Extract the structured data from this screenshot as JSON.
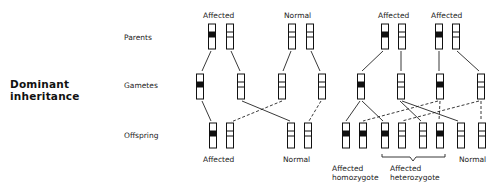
{
  "title": {
    "line1": "Dominant",
    "line2": "inheritance"
  },
  "row_labels": {
    "parents": "Parents",
    "gametes": "Gametes",
    "offspring": "Offspring"
  },
  "cross1": {
    "parent_labels": [
      "Affected",
      "Normal"
    ],
    "offspring_labels": [
      "Affected",
      "Normal"
    ]
  },
  "cross2": {
    "parent_labels": [
      "Affected",
      "Affected"
    ],
    "offspring_labels": {
      "homozygote_line1": "Affected",
      "homozygote_line2": "homozygote",
      "heterozygote_line1": "Affected",
      "heterozygote_line2": "heterozygote",
      "normal": "Normal"
    }
  },
  "legend": {
    "affected_band_color": "#111111",
    "normal_band_color": "#ffffff"
  }
}
